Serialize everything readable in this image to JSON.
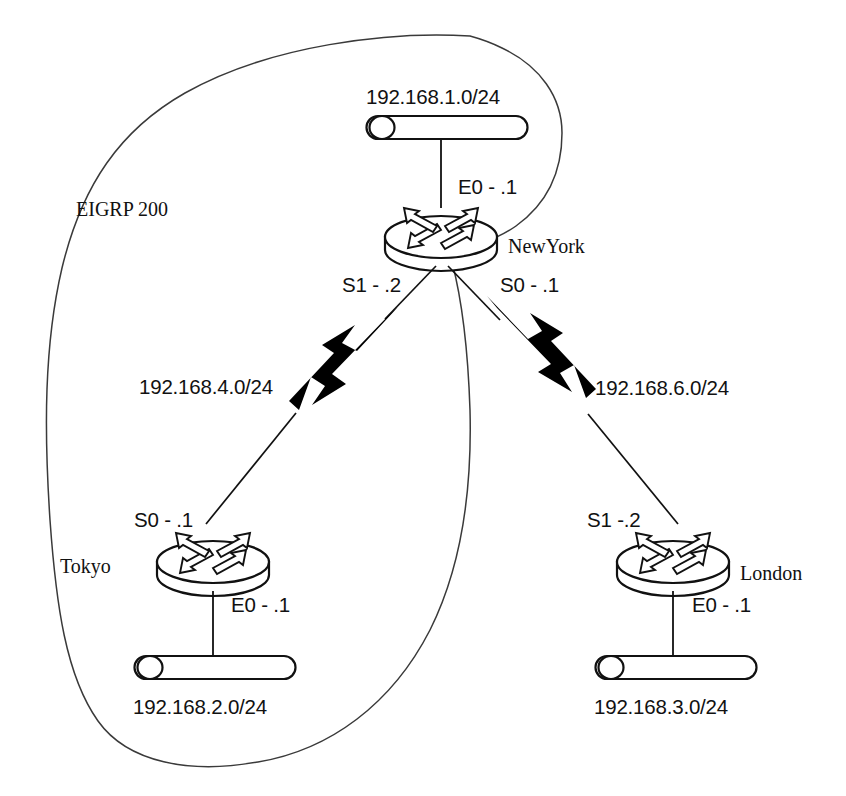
{
  "diagram": {
    "cloud_label": "EIGRP 200",
    "stroke_color": "#111111",
    "cloud_stroke_color": "#3a3a3a",
    "background_color": "#ffffff"
  },
  "routers": [
    {
      "id": "newyork",
      "name": "NewYork",
      "interfaces": {
        "ethernet": "E0 - .1",
        "serial_left": "S1 - .2",
        "serial_right": "S0 - .1"
      }
    },
    {
      "id": "tokyo",
      "name": "Tokyo",
      "interfaces": {
        "ethernet": "E0 - .1",
        "serial": "S0 - .1"
      }
    },
    {
      "id": "london",
      "name": "London",
      "interfaces": {
        "ethernet": "E0 - .1",
        "serial": "S1 -.2"
      }
    }
  ],
  "lans": [
    {
      "id": "lan-newyork",
      "network": "192.168.1.0/24"
    },
    {
      "id": "lan-tokyo",
      "network": "192.168.2.0/24"
    },
    {
      "id": "lan-london",
      "network": "192.168.3.0/24"
    }
  ],
  "wan_links": [
    {
      "id": "wan-ny-tokyo",
      "network": "192.168.4.0/24"
    },
    {
      "id": "wan-ny-london",
      "network": "192.168.6.0/24"
    }
  ]
}
